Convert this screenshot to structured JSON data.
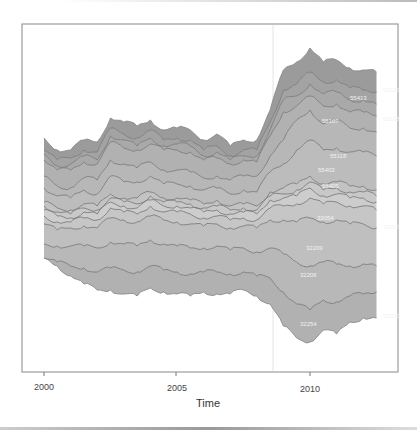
{
  "chart_data": {
    "type": "area",
    "subtype": "streamgraph",
    "title": "",
    "xlabel": "Time",
    "ylabel": "",
    "xlim": [
      1999.2,
      2013.3
    ],
    "x_ticks": [
      2000,
      2005,
      2010
    ],
    "x_tick_labels": [
      "2000",
      "2005",
      "2010"
    ],
    "grid": false,
    "legend": "none (inline series labels at right edge)",
    "vline_x": 2008.7,
    "x": [
      2000.0,
      2000.5,
      2001.0,
      2001.5,
      2002.0,
      2002.5,
      2003.0,
      2003.5,
      2004.0,
      2004.5,
      2005.0,
      2005.5,
      2006.0,
      2006.5,
      2007.0,
      2007.5,
      2008.0,
      2008.5,
      2009.0,
      2009.5,
      2010.0,
      2010.5,
      2011.0,
      2011.5,
      2012.0,
      2012.5
    ],
    "boundaries_px": [
      [
        138,
        150,
        150,
        140,
        142,
        118,
        122,
        126,
        120,
        130,
        128,
        130,
        140,
        134,
        146,
        140,
        140,
        110,
        70,
        62,
        48,
        62,
        60,
        68,
        70,
        72
      ],
      [
        150,
        160,
        158,
        150,
        152,
        128,
        134,
        138,
        130,
        140,
        138,
        140,
        150,
        146,
        156,
        150,
        150,
        122,
        90,
        84,
        72,
        82,
        80,
        88,
        90,
        92
      ],
      [
        154,
        166,
        164,
        156,
        160,
        136,
        140,
        146,
        138,
        146,
        144,
        146,
        156,
        152,
        160,
        156,
        156,
        130,
        100,
        96,
        84,
        94,
        92,
        100,
        100,
        104
      ],
      [
        160,
        170,
        170,
        162,
        164,
        142,
        148,
        150,
        144,
        150,
        150,
        152,
        160,
        158,
        164,
        160,
        162,
        136,
        112,
        106,
        96,
        106,
        104,
        112,
        112,
        116
      ],
      [
        176,
        186,
        188,
        178,
        180,
        160,
        164,
        168,
        162,
        170,
        170,
        172,
        178,
        176,
        180,
        176,
        176,
        156,
        140,
        120,
        110,
        124,
        120,
        128,
        128,
        132
      ],
      [
        188,
        196,
        198,
        190,
        194,
        176,
        182,
        182,
        176,
        184,
        184,
        186,
        190,
        188,
        194,
        190,
        192,
        172,
        164,
        150,
        140,
        150,
        148,
        152,
        152,
        156
      ],
      [
        202,
        208,
        210,
        204,
        206,
        194,
        198,
        198,
        192,
        198,
        198,
        200,
        204,
        200,
        206,
        204,
        206,
        192,
        188,
        184,
        176,
        184,
        182,
        186,
        186,
        190
      ],
      [
        206,
        212,
        214,
        208,
        210,
        198,
        202,
        204,
        196,
        202,
        202,
        204,
        208,
        206,
        210,
        208,
        210,
        196,
        194,
        190,
        182,
        190,
        188,
        192,
        192,
        196
      ],
      [
        210,
        216,
        218,
        212,
        214,
        202,
        206,
        208,
        200,
        206,
        206,
        208,
        212,
        210,
        214,
        212,
        214,
        200,
        198,
        196,
        188,
        196,
        194,
        198,
        198,
        202
      ],
      [
        216,
        222,
        222,
        218,
        220,
        208,
        212,
        214,
        206,
        212,
        212,
        214,
        218,
        216,
        220,
        218,
        220,
        208,
        206,
        204,
        198,
        204,
        202,
        206,
        206,
        210
      ],
      [
        224,
        230,
        228,
        226,
        228,
        218,
        220,
        222,
        216,
        220,
        222,
        224,
        226,
        224,
        228,
        226,
        228,
        220,
        220,
        222,
        218,
        222,
        220,
        224,
        224,
        228
      ],
      [
        244,
        246,
        246,
        246,
        248,
        242,
        244,
        246,
        240,
        244,
        246,
        248,
        248,
        246,
        250,
        248,
        252,
        248,
        254,
        262,
        266,
        262,
        264,
        266,
        264,
        266
      ],
      [
        258,
        262,
        266,
        268,
        272,
        268,
        270,
        272,
        266,
        270,
        272,
        274,
        272,
        272,
        274,
        272,
        276,
        278,
        292,
        304,
        310,
        300,
        302,
        296,
        294,
        292
      ],
      [
        258,
        266,
        276,
        284,
        290,
        290,
        294,
        296,
        288,
        292,
        294,
        296,
        292,
        294,
        294,
        290,
        296,
        304,
        326,
        338,
        342,
        330,
        334,
        322,
        318,
        318
      ]
    ],
    "inline_labels": [
      {
        "text": "55101",
        "x": 383,
        "y": 92
      },
      {
        "text": "55413",
        "x": 350,
        "y": 100
      },
      {
        "text": "55108",
        "x": 383,
        "y": 121
      },
      {
        "text": "55107",
        "x": 322,
        "y": 123
      },
      {
        "text": "55118",
        "x": 330,
        "y": 158
      },
      {
        "text": "55403",
        "x": 318,
        "y": 172
      },
      {
        "text": "55405",
        "x": 322,
        "y": 188
      },
      {
        "text": "33207",
        "x": 383,
        "y": 229
      },
      {
        "text": "33054",
        "x": 317,
        "y": 220
      },
      {
        "text": "32209",
        "x": 306,
        "y": 250
      },
      {
        "text": "32206",
        "x": 300,
        "y": 277
      },
      {
        "text": "32230",
        "x": 383,
        "y": 318
      },
      {
        "text": "32254",
        "x": 300,
        "y": 326
      }
    ]
  },
  "colors": {
    "fills": [
      "#9b9b9b",
      "#a3a3a3",
      "#a9a9a9",
      "#b1b1b1",
      "#b7b7b7",
      "#bcbcbc",
      "#c3c3c3",
      "#c8c8c8",
      "#cdcdcd",
      "#c6c6c6",
      "#bfbfbf",
      "#b8b8b8",
      "#b1b1b1"
    ],
    "line": "#7a7a7a",
    "outline": "#8a8a8a",
    "axis": "#777777",
    "vline": "#e4e4e4"
  },
  "axis": {
    "x_title": "Time",
    "tick_labels": [
      "2000",
      "2005",
      "2010"
    ]
  }
}
